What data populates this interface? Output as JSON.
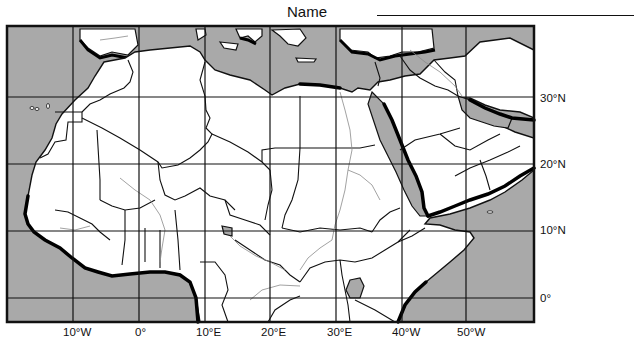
{
  "worksheet": {
    "name_label": "Name",
    "name_value": ""
  },
  "map": {
    "region": "North Africa and Southwest Asia",
    "colors": {
      "water": "#a9a9a9",
      "land": "#ffffff",
      "border": "#111111",
      "river": "#8a8a8a",
      "coast_shadow": "#000000"
    },
    "latitude_labels": [
      "30°N",
      "20°N",
      "10°N",
      "0°"
    ],
    "longitude_labels": [
      "10°W",
      "0°",
      "10°E",
      "20°E",
      "30°E",
      "40°W",
      "50°W"
    ]
  }
}
